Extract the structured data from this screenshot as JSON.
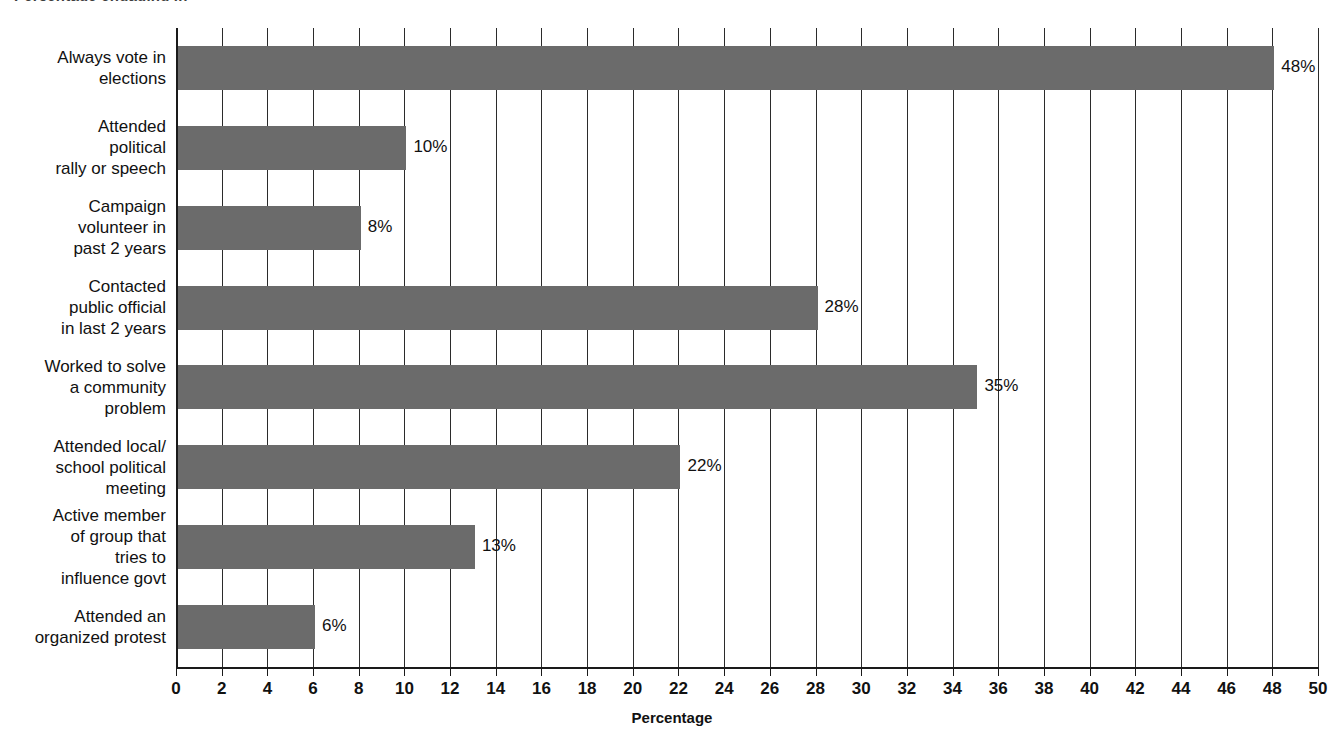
{
  "figure": {
    "title_remnant": "Percentage engaging in",
    "background": "#ffffff",
    "bar_color": "#6b6b6b"
  },
  "chart_data": {
    "type": "bar",
    "orientation": "horizontal",
    "title": "",
    "xlabel": "Percentage",
    "ylabel": "",
    "xlim": [
      0,
      50
    ],
    "xtick_step": 2,
    "grid": true,
    "legend": false,
    "categories": [
      "Always vote in\nelections",
      "Attended\npolitical\nrally or speech",
      "Campaign\nvolunteer in\npast 2 years",
      "Contacted\npublic official\nin last 2 years",
      "Worked to solve\na community\nproblem",
      "Attended local/\nschool political\nmeeting",
      "Active member\nof group that\ntries to\ninfluence govt",
      "Attended an\norganized protest"
    ],
    "values": [
      48,
      10,
      8,
      28,
      35,
      22,
      13,
      6
    ],
    "value_labels": [
      "48%",
      "10%",
      "8%",
      "28%",
      "35%",
      "22%",
      "13%",
      "6%"
    ],
    "xticks": [
      0,
      2,
      4,
      6,
      8,
      10,
      12,
      14,
      16,
      18,
      20,
      22,
      24,
      26,
      28,
      30,
      32,
      34,
      36,
      38,
      40,
      42,
      44,
      46,
      48,
      50
    ],
    "xticklabels": [
      "0",
      "2",
      "4",
      "6",
      "8",
      "10",
      "12",
      "14",
      "16",
      "18",
      "20",
      "22",
      "24",
      "26",
      "28",
      "30",
      "32",
      "34",
      "36",
      "38",
      "40",
      "42",
      "44",
      "46",
      "48",
      "50"
    ]
  }
}
